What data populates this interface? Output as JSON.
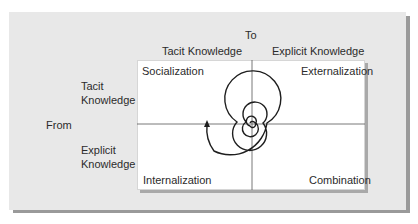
{
  "diagram": {
    "to_label": "To",
    "from_label": "From",
    "columns": [
      {
        "label": "Tacit Knowledge"
      },
      {
        "label": "Explicit Knowledge"
      }
    ],
    "rows": [
      {
        "line1": "Tacit",
        "line2": "Knowledge"
      },
      {
        "line1": "Explicit",
        "line2": "Knowledge"
      }
    ],
    "quadrants": {
      "top_left": "Socialization",
      "top_right": "Externalization",
      "bottom_left": "Internalization",
      "bottom_right": "Combination"
    },
    "spiral": {
      "direction": "outward",
      "arrow": "up-left"
    },
    "colors": {
      "panel": "#e8e8e8",
      "panel_shadow": "#9a9a9a",
      "box": "#ffffff",
      "lines": "#555555",
      "spiral": "#1e1e1e"
    }
  }
}
